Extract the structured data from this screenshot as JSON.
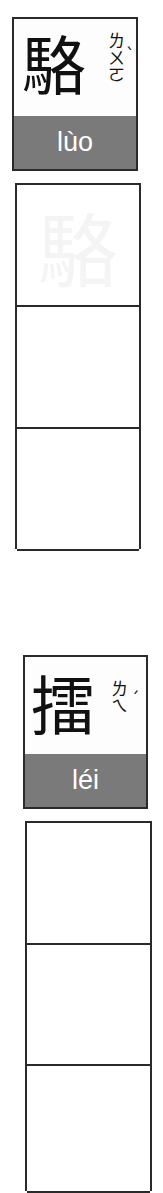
{
  "entries": [
    {
      "character": "駱",
      "zhuyin": [
        "ㄌ",
        "ㄨ",
        "ㄛ"
      ],
      "tone_mark": "ˋ",
      "pinyin": "lùo",
      "practice_cells": 3,
      "ghost_character": "駱"
    },
    {
      "character": "擂",
      "zhuyin": [
        "ㄌ",
        "ㄟ"
      ],
      "tone_mark": "ˊ",
      "pinyin": "léi",
      "practice_cells": 3,
      "ghost_character": "擂"
    }
  ],
  "colors": {
    "border": "#2a2a2a",
    "pinyin_band": "#7a7a7a",
    "pinyin_text": "#ffffff",
    "ghost": "#f4f4f4"
  }
}
